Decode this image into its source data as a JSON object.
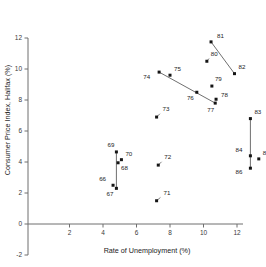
{
  "chart_data": {
    "type": "scatter",
    "title": "",
    "xlabel": "Rate of Unemployment (%)",
    "ylabel": "Consumer Price Index, Halifax (%)",
    "xlim": [
      -2.6,
      12.6
    ],
    "ylim": [
      -2,
      12
    ],
    "xticks": [
      2,
      4,
      6,
      8,
      10,
      12
    ],
    "xticklabels": [
      "2",
      "4",
      "6",
      "8",
      "10",
      "12"
    ],
    "yticks": [
      -2,
      0,
      2,
      4,
      6,
      8,
      10,
      12
    ],
    "yticklabels": [
      "-2",
      "0",
      "2",
      "4",
      "6",
      "8",
      "10",
      "12"
    ],
    "grid": false,
    "legend": false,
    "point_label_field": "year",
    "points": [
      {
        "year": "66",
        "x": 4.6,
        "y": 2.5,
        "lx": -7,
        "ly": -4
      },
      {
        "year": "67",
        "x": 4.8,
        "y": 2.3,
        "lx": -3,
        "ly": 8
      },
      {
        "year": "68",
        "x": 4.9,
        "y": 3.95,
        "lx": 3,
        "ly": 7
      },
      {
        "year": "69",
        "x": 4.8,
        "y": 4.65,
        "lx": -2,
        "ly": -5
      },
      {
        "year": "70",
        "x": 5.1,
        "y": 4.15,
        "lx": 4,
        "ly": -4
      },
      {
        "year": "71",
        "x": 7.2,
        "y": 1.5,
        "lx": 7,
        "ly": -6
      },
      {
        "year": "72",
        "x": 7.3,
        "y": 3.8,
        "lx": 6,
        "ly": -6
      },
      {
        "year": "73",
        "x": 7.2,
        "y": 6.9,
        "lx": 6,
        "ly": -6
      },
      {
        "year": "74",
        "x": 7.35,
        "y": 9.8,
        "lx": -9,
        "ly": 7
      },
      {
        "year": "75",
        "x": 8.0,
        "y": 9.6,
        "lx": 4,
        "ly": -4
      },
      {
        "year": "76",
        "x": 9.6,
        "y": 8.5,
        "lx": -3,
        "ly": 8
      },
      {
        "year": "77",
        "x": 10.7,
        "y": 7.8,
        "lx": -1,
        "ly": 9
      },
      {
        "year": "78",
        "x": 10.75,
        "y": 8.05,
        "lx": 5,
        "ly": -2
      },
      {
        "year": "79",
        "x": 10.5,
        "y": 8.9,
        "lx": 3,
        "ly": -5
      },
      {
        "year": "80",
        "x": 10.2,
        "y": 10.5,
        "lx": 4,
        "ly": -5
      },
      {
        "year": "81",
        "x": 10.45,
        "y": 11.75,
        "lx": 6,
        "ly": -4
      },
      {
        "year": "82",
        "x": 11.85,
        "y": 9.7,
        "lx": 4,
        "ly": -5
      },
      {
        "year": "83",
        "x": 12.8,
        "y": 6.8,
        "lx": 4,
        "ly": -5
      },
      {
        "year": "84",
        "x": 12.8,
        "y": 4.4,
        "lx": -8,
        "ly": -4
      },
      {
        "year": "85",
        "x": 13.3,
        "y": 4.2,
        "lx": 4,
        "ly": -4
      },
      {
        "year": "86",
        "x": 12.8,
        "y": 3.6,
        "lx": -8,
        "ly": 6
      }
    ],
    "connectors": [
      {
        "from": "81",
        "to": "82"
      },
      {
        "from": "74",
        "to": "77"
      },
      {
        "from": "69",
        "to": "67"
      },
      {
        "from": "83",
        "to": "86"
      }
    ],
    "leaders": [
      {
        "year": "73"
      },
      {
        "year": "72"
      },
      {
        "year": "71"
      },
      {
        "year": "80"
      }
    ]
  }
}
